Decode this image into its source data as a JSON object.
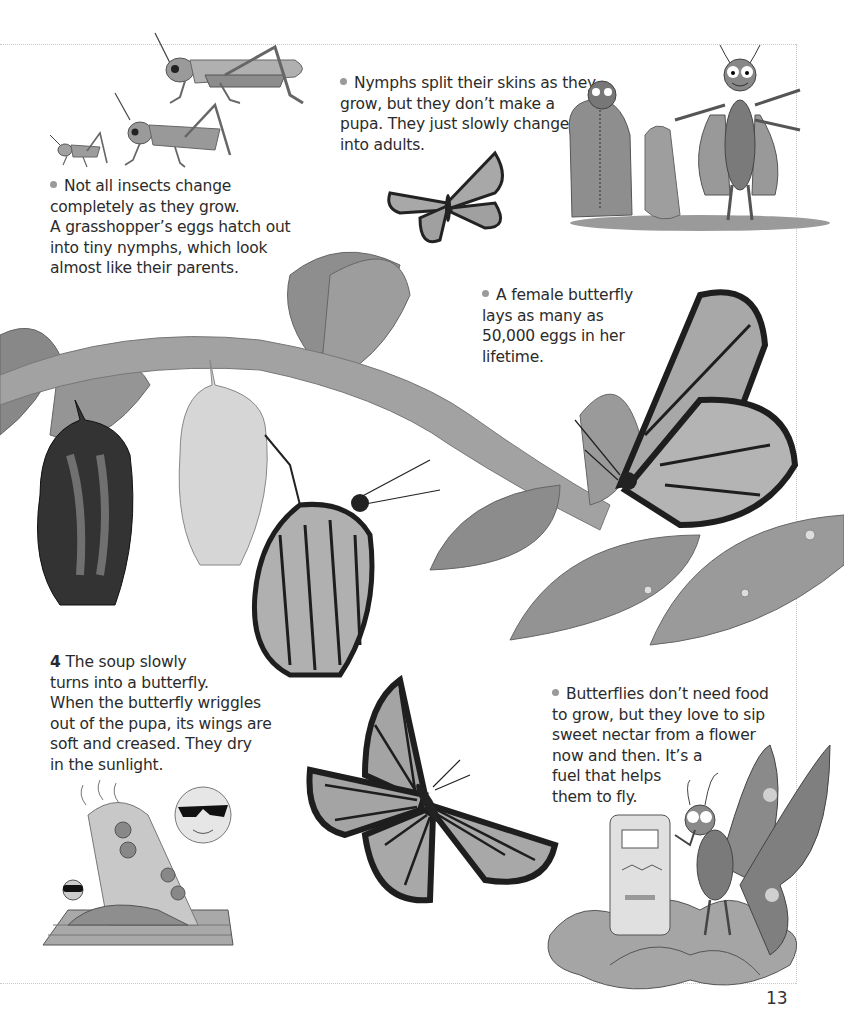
{
  "page": {
    "page_number": "13"
  },
  "captions": {
    "grasshopper": {
      "lines": [
        "Not all insects change",
        "completely as they grow.",
        "A grasshopper’s eggs hatch out",
        "into tiny nymphs, which look",
        "almost like their parents."
      ]
    },
    "nymphs": {
      "lines": [
        "Nymphs split their skins as they",
        "grow, but they don’t make a",
        "pupa. They just slowly change",
        "into adults."
      ]
    },
    "female_butterfly": {
      "lines": [
        "A female butterfly",
        "lays as many as",
        "50,000 eggs in her",
        "lifetime."
      ]
    },
    "step4": {
      "number": "4",
      "lines": [
        "The soup slowly",
        "turns into a butterfly.",
        "When the butterfly wriggles",
        "out of the pupa, its wings are",
        "soft and creased. They dry",
        "in the sunlight."
      ]
    },
    "nectar": {
      "lines": [
        "Butterflies don’t need food",
        "to grow, but they love to sip",
        "sweet nectar from a flower",
        "now and then. It’s a",
        "fuel that helps",
        "them to fly."
      ]
    }
  },
  "illustrations": [
    {
      "name": "grasshopper-growth-stages",
      "depicts": "three grasshoppers: nymph, larger nymph, adult"
    },
    {
      "name": "nymph-shedding-skin-cartoon",
      "depicts": "cartoon insects unzipping and stepping out of old skins"
    },
    {
      "name": "small-flying-monarch",
      "depicts": "monarch butterfly in flight"
    },
    {
      "name": "branch-with-chrysalises",
      "depicts": "branch with leaves, dark chrysalis, empty chrysalis, emerging monarch"
    },
    {
      "name": "female-monarch-on-leaves",
      "depicts": "monarch resting on leaves with eggs"
    },
    {
      "name": "sunbathing-butterfly-cartoon",
      "depicts": "cartoon butterfly in sunglasses drying wings under sun with sunglasses"
    },
    {
      "name": "large-flying-monarch",
      "depicts": "monarch butterfly with wings spread"
    },
    {
      "name": "nectar-pump-cartoon",
      "depicts": "cartoon butterfly refuelling at a nectar pump on a flower"
    }
  ],
  "colors": {
    "text": "#2b2b2b",
    "bullet": "#9a9a9a",
    "frame": "#c8c8c8",
    "wing_dark": "#1e1e1e",
    "wing_light": "#b8b8b8",
    "leaf": "#8a8a8a",
    "branch": "#9c9c9c"
  }
}
